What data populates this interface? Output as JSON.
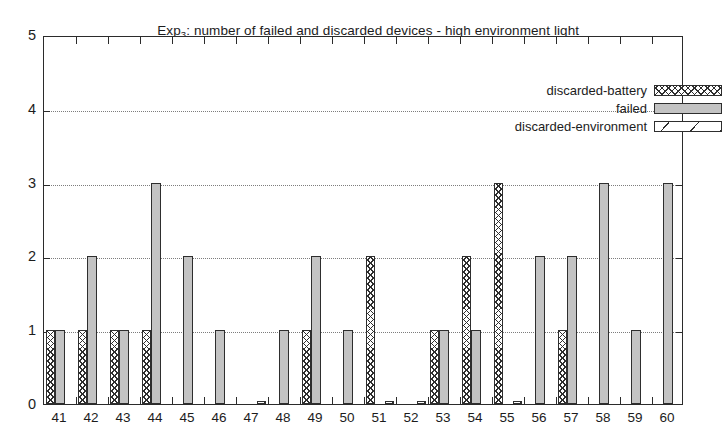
{
  "chart_data": {
    "type": "bar",
    "title": "Exp3: number of failed and discarded devices - high environment light",
    "title_prefix": "Exp",
    "title_subscript": "3",
    "title_suffix": ": number of failed and discarded devices - high environment light",
    "xlabel": "",
    "ylabel": "",
    "ylim": [
      0,
      5
    ],
    "yticks": [
      0,
      1,
      2,
      3,
      4,
      5
    ],
    "ytick_labels": [
      "0",
      "1",
      "2",
      "3",
      "4",
      "5"
    ],
    "grid": true,
    "grid_axis": "y",
    "legend_position": "top-right",
    "categories": [
      "41",
      "42",
      "43",
      "44",
      "45",
      "46",
      "47",
      "48",
      "49",
      "50",
      "51",
      "52",
      "53",
      "54",
      "55",
      "56",
      "57",
      "58",
      "59",
      "60"
    ],
    "series": [
      {
        "name": "discarded-battery",
        "pattern": "crosshatch",
        "color": "#ffffff",
        "values": [
          1,
          1,
          1,
          1,
          0,
          0,
          0,
          0,
          1,
          0,
          2,
          0,
          1,
          2,
          3,
          0,
          1,
          0,
          0,
          0
        ]
      },
      {
        "name": "failed",
        "pattern": "solid-gray",
        "color": "#c3c3c3",
        "values": [
          1,
          2,
          1,
          3,
          2,
          1,
          0,
          1,
          2,
          1,
          0,
          0,
          1,
          1,
          0,
          2,
          2,
          3,
          1,
          3
        ]
      },
      {
        "name": "discarded-environment",
        "pattern": "diagonal",
        "color": "#ffffff",
        "values": [
          0,
          0,
          0,
          0,
          0,
          0,
          0.04,
          0,
          0,
          0,
          0.04,
          0.04,
          0,
          0,
          0.04,
          0,
          0,
          0,
          0,
          0
        ]
      }
    ]
  },
  "legend": {
    "items": [
      {
        "label": "discarded-battery",
        "pattern": "battery"
      },
      {
        "label": "failed",
        "pattern": "failed"
      },
      {
        "label": "discarded-environment",
        "pattern": "environment"
      }
    ]
  }
}
